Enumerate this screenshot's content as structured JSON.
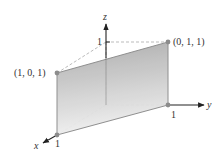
{
  "figure": {
    "type": "3d-plane-diagram",
    "axes": {
      "x_label": "x",
      "y_label": "y",
      "z_label": "z",
      "x_tick": "1",
      "y_tick": "1",
      "z_tick": "1"
    },
    "points": [
      {
        "label": "(1, 0, 1)"
      },
      {
        "label": "(0, 1, 1)"
      }
    ],
    "colors": {
      "plane_top": "#a9a9a9",
      "plane_bottom": "#ececec",
      "edge": "#8a8a8a",
      "axis": "#222222",
      "dashed": "#aaaaaa",
      "point": "#8c8c8c"
    }
  }
}
